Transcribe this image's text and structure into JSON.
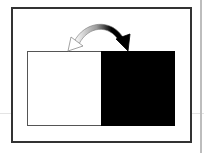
{
  "diagram": {
    "type": "swap-illustration",
    "colors": {
      "background": "#ffffff",
      "frame": "#333333",
      "left_panel": "#ffffff",
      "right_panel": "#000000",
      "arrow_dark": "#000000",
      "arrow_light": "#ffffff"
    },
    "panels": [
      {
        "name": "left",
        "fill": "white"
      },
      {
        "name": "right",
        "fill": "black"
      }
    ],
    "arrow": {
      "icon": "curved-double-arrow-icon",
      "direction": "bidirectional",
      "from": "left-panel",
      "to": "right-panel"
    }
  }
}
